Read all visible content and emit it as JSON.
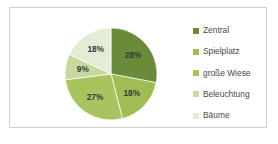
{
  "chart_data": {
    "type": "pie",
    "title": "",
    "categories": [
      "Zentral",
      "Spielplatz",
      "große Wiese",
      "Beleuchtung",
      "Bäume"
    ],
    "values": [
      28,
      18,
      27,
      9,
      18
    ],
    "value_labels": [
      "28%",
      "18%",
      "27%",
      "9%",
      "18%"
    ],
    "units": "percent",
    "colors": [
      "#6a8b3a",
      "#9fbc55",
      "#a8c45f",
      "#c8d9a0",
      "#e3ecd5"
    ],
    "start_angle_deg": 0,
    "direction": "clockwise",
    "legend_position": "right",
    "grid": false,
    "xlabel": "",
    "ylabel": ""
  },
  "legend": {
    "items": [
      {
        "label": "Zentral",
        "color": "#6a8b3a"
      },
      {
        "label": "Spielplatz",
        "color": "#9fbc55"
      },
      {
        "label": "große Wiese",
        "color": "#a8c45f"
      },
      {
        "label": "Beleuchtung",
        "color": "#c8d9a0"
      },
      {
        "label": "Bäume",
        "color": "#e3ecd5"
      }
    ]
  },
  "slices": [
    {
      "label": "28%",
      "x": 68,
      "y": 38
    },
    {
      "label": "18%",
      "x": 62,
      "y": 75
    },
    {
      "label": "27%",
      "x": 28,
      "y": 73
    },
    {
      "label": "9%",
      "x": 16,
      "y": 48
    },
    {
      "label": "18%",
      "x": 32,
      "y": 26
    }
  ],
  "frame": {
    "border_color": "#cfcfcf",
    "background": "#ffffff"
  }
}
